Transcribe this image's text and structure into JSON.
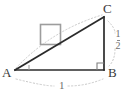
{
  "figure": {
    "kind": "geometry-diagram",
    "colors": {
      "background": "#ffffff",
      "triangle_stroke": "#2b2b2b",
      "square_stroke": "#9a9a9a",
      "guide_stroke": "#c7c7c7",
      "label_text": "#3a3a3a",
      "measure_text": "#6e6e6e"
    },
    "vertices": [
      {
        "name": "A",
        "label": "A",
        "x": 15,
        "y": 70
      },
      {
        "name": "B",
        "label": "B",
        "x": 104,
        "y": 70
      },
      {
        "name": "C",
        "label": "C",
        "x": 104,
        "y": 17
      }
    ],
    "measures": {
      "base_label": "1",
      "height_numerator": "1",
      "height_denominator": "2"
    },
    "markers": {
      "right_angle_at": "B",
      "angle_tick_at": "A",
      "square_on_hypotenuse": true
    }
  }
}
